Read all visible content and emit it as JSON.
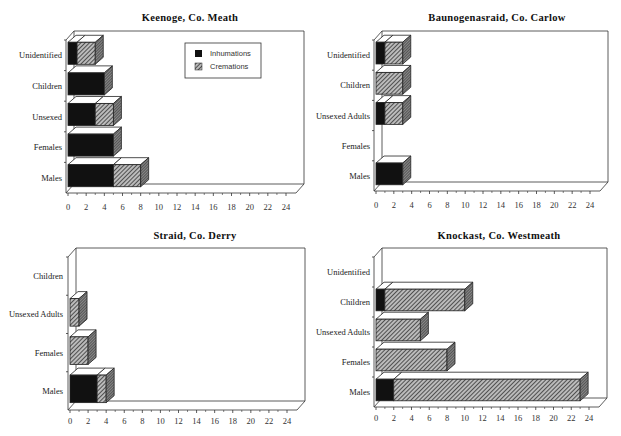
{
  "legend": {
    "inhumations_label": "Inhumations",
    "cremations_label": "Cremations",
    "inhumations_color": "#111111",
    "cremations_pattern": "diagonal-hatch"
  },
  "chart_data": [
    {
      "type": "bar",
      "orientation": "horizontal-stacked-3d",
      "title": "Keenoge,  Co.  Meath",
      "categories": [
        "Males",
        "Females",
        "Unsexed",
        "Children",
        "Unidentified"
      ],
      "series": [
        {
          "name": "Inhumations",
          "values": [
            5,
            5,
            3,
            4,
            1
          ]
        },
        {
          "name": "Cremations",
          "values": [
            3,
            0,
            2,
            0,
            2
          ]
        }
      ],
      "xticks": [
        "0",
        "2",
        "4",
        "6",
        "8",
        "10",
        "12",
        "14",
        "16",
        "18",
        "20",
        "22",
        "24"
      ],
      "xlim": [
        0,
        24
      ],
      "legend": true,
      "legend_position": "upper-right inside plot"
    },
    {
      "type": "bar",
      "orientation": "horizontal-stacked-3d",
      "title": "Baunogenasraid,  Co.  Carlow",
      "categories": [
        "Males",
        "Females",
        "Unsexed Adults",
        "Children",
        "Unidentified"
      ],
      "series": [
        {
          "name": "Inhumations",
          "values": [
            3,
            0,
            1,
            0,
            1
          ]
        },
        {
          "name": "Cremations",
          "values": [
            0,
            0,
            2,
            3,
            2
          ]
        }
      ],
      "xticks": [
        "0",
        "2",
        "4",
        "6",
        "8",
        "10",
        "12",
        "14",
        "16",
        "18",
        "20",
        "22",
        "24"
      ],
      "xlim": [
        0,
        24
      ],
      "legend": false
    },
    {
      "type": "bar",
      "orientation": "horizontal-stacked-3d",
      "title": "Straid,  Co.  Derry",
      "categories": [
        "Males",
        "Females",
        "Unsexed Adults",
        "Children"
      ],
      "series": [
        {
          "name": "Inhumations",
          "values": [
            3,
            0,
            0,
            0
          ]
        },
        {
          "name": "Cremations",
          "values": [
            1,
            2,
            1,
            0
          ]
        }
      ],
      "xticks": [
        "0",
        "2",
        "4",
        "6",
        "8",
        "10",
        "12",
        "14",
        "16",
        "18",
        "20",
        "22",
        "24"
      ],
      "xlim": [
        0,
        24
      ],
      "legend": false
    },
    {
      "type": "bar",
      "orientation": "horizontal-stacked-3d",
      "title": "Knockast,  Co.  Westmeath",
      "categories": [
        "Males",
        "Females",
        "Unsexed Adults",
        "Children",
        "Unidentified"
      ],
      "series": [
        {
          "name": "Inhumations",
          "values": [
            2,
            0,
            0,
            1,
            0
          ]
        },
        {
          "name": "Cremations",
          "values": [
            21,
            8,
            5,
            9,
            0
          ]
        }
      ],
      "xticks": [
        "0",
        "2",
        "4",
        "6",
        "8",
        "10",
        "12",
        "14",
        "16",
        "18",
        "20",
        "22",
        "24"
      ],
      "xlim": [
        0,
        24
      ],
      "legend": false
    }
  ],
  "layout": [
    {
      "x0": 68,
      "x24": 286,
      "top": 31,
      "floor": 193,
      "tickY": 210,
      "titleX": 190,
      "titleY": 12,
      "catRight": 62
    },
    {
      "x0": 376,
      "x24": 590,
      "top": 31,
      "floor": 191,
      "tickY": 208,
      "titleX": 497,
      "titleY": 12,
      "catRight": 370
    },
    {
      "x0": 70,
      "x24": 287,
      "top": 248,
      "floor": 410,
      "tickY": 424,
      "titleX": 195,
      "titleY": 230,
      "catRight": 63
    },
    {
      "x0": 376,
      "x24": 589,
      "top": 248,
      "floor": 407,
      "tickY": 421,
      "titleX": 499,
      "titleY": 230,
      "catRight": 370
    }
  ]
}
